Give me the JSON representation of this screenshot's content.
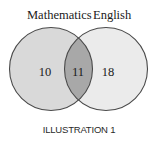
{
  "diagram": {
    "type": "venn",
    "sets": [
      {
        "label": "Mathematics",
        "only_count": "10",
        "fill": "#d9d9d9"
      },
      {
        "label": "English",
        "only_count": "18",
        "fill": "#ebebeb"
      }
    ],
    "intersection": {
      "count": "11",
      "fill": "#a8a8a8"
    },
    "outline_color": "#4a4a4a",
    "caption": "ILLUSTRATION 1"
  }
}
